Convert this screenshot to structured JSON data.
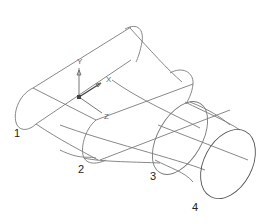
{
  "diagram": {
    "type": "wireframe-loft",
    "section_labels": [
      "1",
      "2",
      "3",
      "4"
    ],
    "ucs_icon": {
      "x_label": "X",
      "y_label": "Y",
      "z_label": "Z"
    },
    "colors": {
      "wire": "#7a7a7a",
      "background": "#ffffff",
      "label": "#222222"
    }
  }
}
